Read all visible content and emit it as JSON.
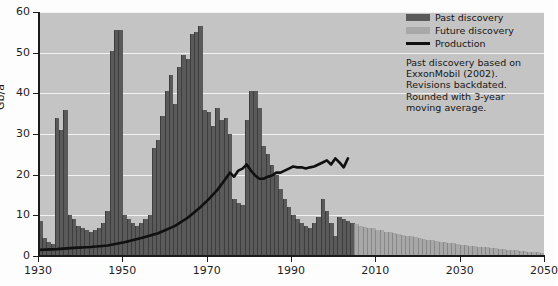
{
  "chart_data": {
    "type": "bar",
    "title": "",
    "xlabel": "",
    "ylabel": "Gb/a",
    "xlim": [
      1930,
      2050
    ],
    "ylim": [
      0,
      60
    ],
    "yticks": [
      0,
      10,
      20,
      30,
      40,
      50,
      60
    ],
    "xticks": [
      1930,
      1950,
      1970,
      1990,
      2010,
      2030,
      2050
    ],
    "grid": true,
    "legend_position": "top-right",
    "series": [
      {
        "name": "Past discovery",
        "color": "#5a5a5a",
        "type": "bar",
        "x": [
          1930,
          1931,
          1932,
          1933,
          1934,
          1935,
          1936,
          1937,
          1938,
          1939,
          1940,
          1941,
          1942,
          1943,
          1944,
          1945,
          1946,
          1947,
          1948,
          1949,
          1950,
          1951,
          1952,
          1953,
          1954,
          1955,
          1956,
          1957,
          1958,
          1959,
          1960,
          1961,
          1962,
          1963,
          1964,
          1965,
          1966,
          1967,
          1968,
          1969,
          1970,
          1971,
          1972,
          1973,
          1974,
          1975,
          1976,
          1977,
          1978,
          1979,
          1980,
          1981,
          1982,
          1983,
          1984,
          1985,
          1986,
          1987,
          1988,
          1989,
          1990,
          1991,
          1992,
          1993,
          1994,
          1995,
          1996,
          1997,
          1998,
          1999,
          2000,
          2001,
          2002,
          2003,
          2004
        ],
        "values": [
          8.5,
          4.5,
          3.5,
          3.0,
          34.0,
          31.0,
          36.0,
          10.0,
          9.0,
          7.5,
          7.0,
          6.5,
          6.0,
          6.5,
          7.0,
          8.0,
          11.0,
          50.5,
          55.5,
          55.5,
          10.0,
          9.0,
          8.0,
          7.5,
          8.0,
          9.0,
          10.0,
          26.5,
          28.5,
          34.5,
          40.5,
          44.5,
          37.5,
          46.5,
          49.5,
          48.5,
          54.5,
          55.0,
          56.5,
          36.0,
          35.5,
          32.0,
          36.5,
          33.5,
          34.0,
          30.0,
          14.0,
          13.0,
          12.5,
          33.5,
          40.5,
          40.5,
          36.5,
          27.0,
          25.0,
          22.5,
          20.0,
          16.5,
          14.0,
          12.0,
          10.0,
          9.0,
          8.0,
          7.5,
          7.0,
          8.0,
          9.5,
          14.0,
          11.0,
          8.0,
          5.0,
          9.5,
          9.0,
          8.5,
          8.0
        ]
      },
      {
        "name": "Future discovery",
        "color": "#a8a8a8",
        "type": "bar",
        "x": [
          2005,
          2006,
          2007,
          2008,
          2009,
          2010,
          2011,
          2012,
          2013,
          2014,
          2015,
          2016,
          2017,
          2018,
          2019,
          2020,
          2021,
          2022,
          2023,
          2024,
          2025,
          2026,
          2027,
          2028,
          2029,
          2030,
          2031,
          2032,
          2033,
          2034,
          2035,
          2036,
          2037,
          2038,
          2039,
          2040,
          2041,
          2042,
          2043,
          2044,
          2045,
          2046,
          2047,
          2048,
          2049,
          2050
        ],
        "values": [
          7.8,
          7.5,
          7.2,
          7.0,
          6.8,
          6.5,
          6.3,
          6.0,
          5.8,
          5.6,
          5.4,
          5.2,
          5.0,
          4.8,
          4.6,
          4.4,
          4.2,
          4.0,
          3.9,
          3.7,
          3.5,
          3.4,
          3.2,
          3.1,
          2.9,
          2.8,
          2.7,
          2.5,
          2.4,
          2.3,
          2.2,
          2.1,
          2.0,
          1.9,
          1.8,
          1.7,
          1.6,
          1.5,
          1.4,
          1.3,
          1.2,
          1.1,
          1.0,
          0.9,
          0.8,
          0.7
        ]
      },
      {
        "name": "Production",
        "color": "#101010",
        "type": "line",
        "x": [
          1930,
          1934,
          1938,
          1942,
          1946,
          1950,
          1954,
          1958,
          1962,
          1965,
          1968,
          1970,
          1972,
          1974,
          1975,
          1976,
          1977,
          1978,
          1979,
          1980,
          1981,
          1982,
          1983,
          1984,
          1985,
          1986,
          1987,
          1988,
          1989,
          1990,
          1991,
          1992,
          1993,
          1994,
          1995,
          1996,
          1997,
          1998,
          1999,
          2000,
          2001,
          2002,
          2003
        ],
        "values": [
          1.5,
          1.7,
          2.0,
          2.2,
          2.6,
          3.4,
          4.4,
          5.6,
          7.4,
          9.4,
          12.0,
          14.0,
          16.2,
          19.0,
          20.5,
          19.5,
          21.0,
          21.5,
          22.5,
          21.0,
          19.8,
          19.0,
          19.0,
          19.5,
          19.8,
          20.5,
          20.5,
          21.0,
          21.5,
          22.0,
          21.8,
          21.8,
          21.5,
          21.8,
          22.0,
          22.5,
          23.0,
          23.5,
          22.5,
          24.0,
          23.0,
          21.8,
          24.0
        ]
      }
    ]
  },
  "legend": {
    "items": [
      {
        "label": "Past discovery",
        "key": "past"
      },
      {
        "label": "Future discovery",
        "key": "future"
      },
      {
        "label": "Production",
        "key": "prod"
      }
    ]
  },
  "annotation": {
    "line1": "Past discovery based on",
    "line2": "ExxonMobil (2002).",
    "line3": "Revisions backdated.",
    "line4": "Rounded with 3-year",
    "line5": "moving average."
  },
  "axes": {
    "y_title": "Gb/a",
    "y_tick_labels": [
      "0",
      "10",
      "20",
      "30",
      "40",
      "50",
      "60"
    ],
    "x_tick_labels": [
      "1930",
      "1950",
      "1970",
      "1990",
      "2010",
      "2030",
      "2050"
    ]
  },
  "colors": {
    "past": "#5a5a5a",
    "future": "#a8a8a8",
    "production": "#101010",
    "plot_background": "#c4c4c4",
    "gridline": "#f2f2f2"
  }
}
